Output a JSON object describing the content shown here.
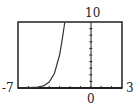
{
  "chart_data": {
    "type": "line",
    "title": "",
    "xlabel": "",
    "ylabel": "",
    "xlim": [
      -7,
      3
    ],
    "ylim": [
      0,
      10
    ],
    "tick_labels": {
      "xmin": "-7",
      "xmax": "3",
      "ymax": "10",
      "xorigin": "0"
    },
    "x_tick_spacing": 1,
    "y_tick_spacing": 1,
    "grid": false,
    "series": [
      {
        "name": "curve",
        "description": "exponential growth, near 0 for x < -4.5, reaches 10 at about x = -2.5",
        "x": [
          -7,
          -6,
          -5,
          -4.5,
          -4,
          -3.5,
          -3,
          -2.7,
          -2.5
        ],
        "y": [
          0.02,
          0.05,
          0.15,
          0.35,
          0.9,
          2.2,
          5.0,
          7.8,
          10
        ]
      }
    ]
  },
  "labels": {
    "xmin": "-7",
    "xmax": "3",
    "ymax": "10",
    "origin": "0"
  }
}
